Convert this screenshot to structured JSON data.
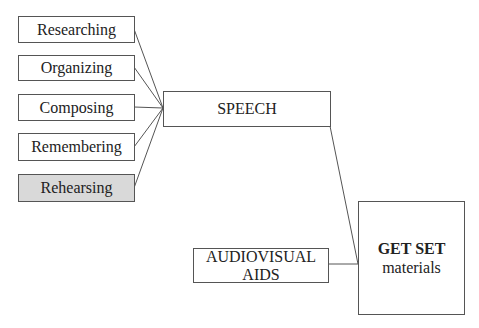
{
  "diagram": {
    "inputs": [
      {
        "label": "Researching",
        "shaded": false
      },
      {
        "label": "Organizing",
        "shaded": false
      },
      {
        "label": "Composing",
        "shaded": false
      },
      {
        "label": "Remembering",
        "shaded": false
      },
      {
        "label": "Rehearsing",
        "shaded": true
      }
    ],
    "speech": {
      "label": "SPEECH"
    },
    "audiovisual": {
      "label": "AUDIOVISUAL AIDS"
    },
    "output": {
      "title": "GET SET",
      "subtitle": "materials"
    },
    "colors": {
      "line": "#555555",
      "border": "#555555",
      "highlight_fill": "#d9d9d9"
    }
  }
}
